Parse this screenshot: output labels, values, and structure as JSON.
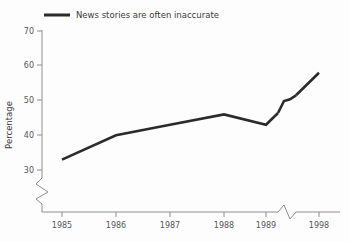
{
  "chart_data": {
    "type": "line",
    "title": "",
    "subtitle": "",
    "xlabel": "",
    "ylabel": "Percentage",
    "legend": [
      "News stories are often inaccurate"
    ],
    "legend_position": "top-left",
    "grid": false,
    "categories": [
      "1985",
      "1986",
      "1987",
      "1988",
      "1989",
      "1998"
    ],
    "x": [
      1985,
      1986,
      1987,
      1988,
      1989,
      1998
    ],
    "values": [
      33,
      40,
      43,
      46,
      43,
      58
    ],
    "series": [
      {
        "name": "News stories are often inaccurate",
        "values": [
          33,
          40,
          43,
          46,
          43,
          58
        ]
      }
    ],
    "ylim": [
      30,
      70
    ],
    "yticks": [
      30,
      40,
      50,
      60,
      70
    ],
    "ytick_labels": [
      "30",
      "40",
      "50",
      "60",
      "70"
    ],
    "xtick_labels": [
      "1985",
      "1986",
      "1987",
      "1988",
      "1989",
      "1998"
    ],
    "axis_breaks": {
      "y_axis_break": true,
      "y_axis_break_note": "zigzag below 30 indicating truncated value axis",
      "x_axis_break": true,
      "x_axis_break_note": "zigzag between 1989 and 1998 indicating skipped years",
      "series_break": true,
      "series_break_note": "zigzag jog in the data line at the x-axis break"
    },
    "colors": {
      "line": "#2b2b2b",
      "axis": "#8d8d8d",
      "text": "#3b3b3b",
      "background": "#fdfdfd"
    }
  },
  "legend": {
    "label": "News stories are often inaccurate"
  },
  "axes": {
    "y_title": "Percentage",
    "y_labels": [
      "70",
      "60",
      "50",
      "40",
      "30"
    ],
    "x_labels": [
      "1985",
      "1986",
      "1987",
      "1988",
      "1989",
      "1998"
    ]
  }
}
